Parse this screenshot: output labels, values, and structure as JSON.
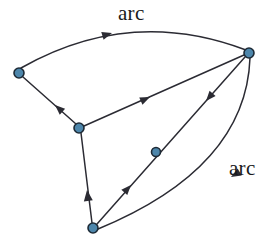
{
  "diagram": {
    "type": "directed-graph",
    "title": "",
    "background_color": "#ffffff",
    "node_fill_color": "#4d86ab",
    "node_stroke_color": "#1d2a36",
    "edge_color": "#2b2b33",
    "label_color": "#1a1a1a",
    "labels": [
      {
        "id": "arc-label-top",
        "text": "arc",
        "x": 118,
        "y": 3
      },
      {
        "id": "arc-label-bottom",
        "text": "arc",
        "x": 229,
        "y": 158
      }
    ],
    "nodes": [
      {
        "id": "n-left",
        "x": 19,
        "y": 73,
        "r": 5
      },
      {
        "id": "n-right",
        "x": 249,
        "y": 53,
        "r": 5
      },
      {
        "id": "n-left-middle",
        "x": 79,
        "y": 128,
        "r": 5
      },
      {
        "id": "n-middle",
        "x": 156,
        "y": 152,
        "r": 4.5
      },
      {
        "id": "n-bottom",
        "x": 93,
        "y": 228,
        "r": 5
      }
    ],
    "edges": [
      {
        "id": "edge-left-to-right-arc",
        "from": "n-left",
        "to": "n-right",
        "shape": "curved",
        "label": "arc",
        "path": "M 21 68 Q 130 6 246 50",
        "arrow": {
          "x": 112,
          "y": 33,
          "angle": -17
        }
      },
      {
        "id": "edge-left-middle-to-left",
        "from": "n-left-middle",
        "to": "n-left",
        "shape": "straight",
        "label": "",
        "path": "M 76 124 L 23 77",
        "arrow": {
          "x": 55,
          "y": 105,
          "angle": -138
        }
      },
      {
        "id": "edge-left-middle-to-right",
        "from": "n-left-middle",
        "to": "n-right",
        "shape": "straight",
        "label": "",
        "path": "M 84 126 L 244 55",
        "arrow": {
          "x": 150,
          "y": 97,
          "angle": -24
        }
      },
      {
        "id": "edge-bottom-to-left-middle",
        "from": "n-bottom",
        "to": "n-left-middle",
        "shape": "straight",
        "label": "",
        "path": "M 92 223 L 81 133",
        "arrow": {
          "x": 87,
          "y": 190,
          "angle": -97
        }
      },
      {
        "id": "edge-bottom-to-right-via-middle",
        "from": "n-bottom",
        "to": "n-right",
        "shape": "straight",
        "label": "",
        "path": "M 97 224 L 245 57",
        "arrow": {
          "x": 131,
          "y": 185,
          "angle": -48
        }
      },
      {
        "id": "edge-right-to-bottom-straightish",
        "from": "n-right",
        "to": "n-bottom",
        "shape": "straight",
        "label": "",
        "path": "M 245 57 L 97 224",
        "arrow": {
          "x": 206,
          "y": 101,
          "angle": 131
        }
      },
      {
        "id": "edge-right-to-bottom-arc",
        "from": "n-right",
        "to": "n-bottom",
        "shape": "curved",
        "label": "arc",
        "path": "M 250 58 Q 246 168 98 229",
        "arrow": {
          "x": 231,
          "y": 177,
          "angle": 150
        }
      }
    ]
  }
}
